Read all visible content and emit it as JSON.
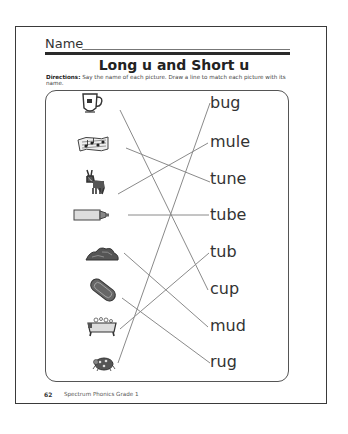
{
  "header": {
    "name_label": "Name",
    "title": "Long u and Short u",
    "directions_label": "Directions:",
    "directions_text": " Say the name of each picture. Draw a line to match each picture with its name."
  },
  "pictures": [
    {
      "label": "cup",
      "icon": "cup-icon"
    },
    {
      "label": "tune",
      "icon": "music-notes-icon"
    },
    {
      "label": "mule",
      "icon": "mule-icon"
    },
    {
      "label": "tube",
      "icon": "tube-icon"
    },
    {
      "label": "mud",
      "icon": "mud-icon"
    },
    {
      "label": "rug",
      "icon": "rug-icon"
    },
    {
      "label": "tub",
      "icon": "bathtub-icon"
    },
    {
      "label": "bug",
      "icon": "bug-icon"
    }
  ],
  "words": [
    "bug",
    "mule",
    "tune",
    "tube",
    "tub",
    "cup",
    "mud",
    "rug"
  ],
  "matches": [
    {
      "picture": 0,
      "word": 5
    },
    {
      "picture": 1,
      "word": 2
    },
    {
      "picture": 2,
      "word": 1
    },
    {
      "picture": 3,
      "word": 3
    },
    {
      "picture": 4,
      "word": 6
    },
    {
      "picture": 5,
      "word": 7
    },
    {
      "picture": 6,
      "word": 4
    },
    {
      "picture": 7,
      "word": 0
    }
  ],
  "footer": {
    "page_number": "62",
    "book_title": "Spectrum Phonics Grade 1"
  },
  "colors": {
    "line": "#8a8a8a",
    "ink": "#2a2a2a"
  }
}
